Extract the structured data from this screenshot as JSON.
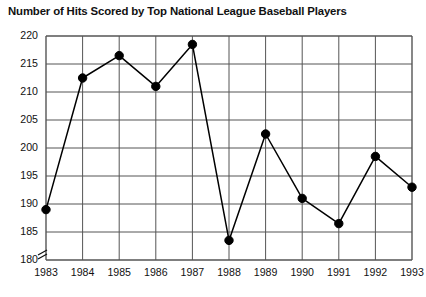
{
  "chart_data": {
    "type": "line",
    "title": "Number of Hits Scored by Top National League Baseball Players",
    "xlabel": "",
    "ylabel": "",
    "categories": [
      "1983",
      "1984",
      "1985",
      "1986",
      "1987",
      "1988",
      "1989",
      "1990",
      "1991",
      "1992",
      "1993"
    ],
    "x": [
      1983,
      1984,
      1985,
      1986,
      1987,
      1988,
      1989,
      1990,
      1991,
      1992,
      1993
    ],
    "values": [
      189,
      212.5,
      216.5,
      211,
      218.5,
      183.5,
      202.5,
      191,
      186.5,
      198.5,
      193
    ],
    "series": [
      {
        "name": "Hits",
        "values": [
          189,
          212.5,
          216.5,
          211,
          218.5,
          183.5,
          202.5,
          191,
          186.5,
          198.5,
          193
        ]
      }
    ],
    "ylim": [
      180,
      220
    ],
    "yticks": [
      180,
      185,
      190,
      195,
      200,
      205,
      210,
      215,
      220
    ],
    "ytick_labels": [
      "180",
      "185",
      "190",
      "195",
      "200",
      "205",
      "210",
      "215",
      "220"
    ],
    "xtick_labels": [
      "1983",
      "1984",
      "1985",
      "1986",
      "1987",
      "1988",
      "1989",
      "1990",
      "1991",
      "1992",
      "1993"
    ],
    "grid": true,
    "legend": false,
    "axis_break": true,
    "marker": "filled-circle",
    "line_color": "#000000",
    "marker_color": "#000000",
    "grid_color": "#555555",
    "background_color": "#ffffff"
  },
  "axis": {
    "y_labels": [
      "220",
      "215",
      "210",
      "205",
      "200",
      "195",
      "190",
      "185",
      "180"
    ],
    "x_labels": [
      "1983",
      "1984",
      "1985",
      "1986",
      "1987",
      "1988",
      "1989",
      "1990",
      "1991",
      "1992",
      "1993"
    ],
    "break_symbol": "axis-break-marker"
  }
}
